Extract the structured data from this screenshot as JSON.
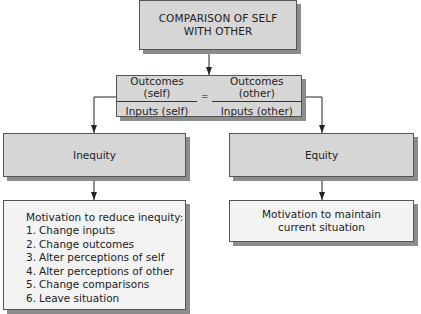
{
  "diagram": {
    "title_box": {
      "line1": "COMPARISON OF SELF",
      "line2": "WITH OTHER"
    },
    "equation_box": {
      "left_fraction": {
        "numerator": "Outcomes (self)",
        "denominator": "Inputs (self)"
      },
      "operator": "=",
      "right_fraction": {
        "numerator": "Outcomes (other)",
        "denominator": "Inputs (other)"
      }
    },
    "left_branch": {
      "label": "Inequity",
      "result": {
        "heading": "Motivation to reduce inequity:",
        "items": [
          {
            "num": "1.",
            "text": "Change inputs"
          },
          {
            "num": "2.",
            "text": "Change outcomes"
          },
          {
            "num": "3.",
            "text": "Alter perceptions of self"
          },
          {
            "num": "4.",
            "text": "Alter perceptions of other"
          },
          {
            "num": "5.",
            "text": "Change comparisons"
          },
          {
            "num": "6.",
            "text": "Leave situation"
          }
        ]
      }
    },
    "right_branch": {
      "label": "Equity",
      "result": {
        "line1": "Motivation to maintain",
        "line2": "current situation"
      }
    },
    "colors": {
      "box_fill_dark": "#d6d6d6",
      "box_fill_light": "#f3f3f3",
      "border": "#555555",
      "shadow": "#8c8c8c",
      "arrow": "#222222"
    }
  }
}
